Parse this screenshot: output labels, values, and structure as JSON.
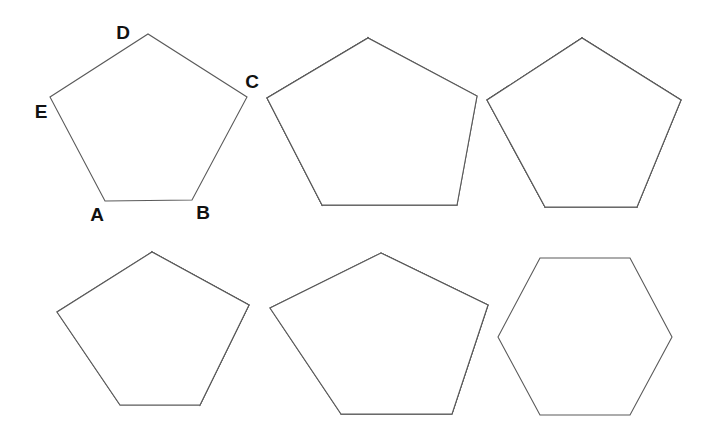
{
  "figure": {
    "background_color": "#ffffff",
    "stroke_color": "#5a5a5a",
    "label_color": "#111111",
    "width": 719,
    "height": 442
  },
  "labels": {
    "A": "A",
    "B": "B",
    "C": "C",
    "D": "D",
    "E": "E"
  },
  "shapes": [
    {
      "id": "pentagon-1-labeled",
      "name": "labeled-pentagon",
      "type": "pentagon",
      "row": 1,
      "column": 1,
      "fill": "none",
      "vertex_labels": [
        "A",
        "B",
        "C",
        "D",
        "E"
      ],
      "regions": []
    },
    {
      "id": "pentagon-2-two-triangles",
      "name": "pentagon-with-two-hatched-triangles",
      "type": "pentagon",
      "row": 1,
      "column": 2,
      "regions": [
        {
          "name": "left-triangle",
          "pattern": "diagonal-hatch",
          "vertices": "D-E-A"
        },
        {
          "name": "middle-triangle",
          "pattern": "cross-hatch",
          "vertices": "D-A-B"
        }
      ]
    },
    {
      "id": "pentagon-3-three-quads",
      "name": "pentagon-split-into-three-quadrilaterals",
      "type": "pentagon",
      "row": 1,
      "column": 3,
      "regions": [
        {
          "name": "left-quad",
          "pattern": "horizontal-hatch",
          "vertices": "D-E-A-center"
        },
        {
          "name": "right-quad",
          "pattern": "vertical-hatch",
          "vertices": "D-center-B-C"
        },
        {
          "name": "bottom-quad",
          "pattern": "none",
          "vertices": "center-A-B"
        }
      ]
    },
    {
      "id": "pentagon-4-one-triangle",
      "name": "pentagon-with-horizontal-hatched-triangle",
      "type": "pentagon",
      "row": 2,
      "column": 1,
      "regions": [
        {
          "name": "right-triangle",
          "pattern": "horizontal-hatch",
          "vertices": "D-C-B"
        }
      ]
    },
    {
      "id": "pentagon-5-one-quad",
      "name": "pentagon-with-cross-hatched-quadrilateral",
      "type": "pentagon",
      "row": 2,
      "column": 2,
      "regions": [
        {
          "name": "right-quad",
          "pattern": "cross-hatch",
          "vertices": "D-C-B-A"
        }
      ]
    },
    {
      "id": "hexagon-6-plain",
      "name": "plain-hexagon",
      "type": "hexagon",
      "row": 2,
      "column": 3,
      "regions": []
    }
  ],
  "patterns": {
    "diagonal-hatch": {
      "name": "diagonal-hatch",
      "color": "#4a4a4a",
      "spacing": 4
    },
    "cross-hatch": {
      "name": "cross-hatch",
      "color": "#4a4a4a",
      "spacing": 4
    },
    "horizontal-hatch": {
      "name": "horizontal-hatch",
      "color": "#3a3a3a",
      "spacing": 6
    },
    "vertical-hatch": {
      "name": "vertical-hatch",
      "color": "#3a3a3a",
      "spacing": 6
    }
  },
  "geometry": {
    "pentagon1": {
      "A": "105,201",
      "B": "192,200",
      "C": "247,97",
      "D": "148,34",
      "E": "50,97"
    },
    "pentagon2": {
      "A": "322,205",
      "B": "457,205",
      "C": "477,96",
      "D": "368,38",
      "E": "267,98"
    },
    "pentagon3": {
      "A": "545,207",
      "B": "637,207",
      "C": "681,100",
      "D": "582,38",
      "E": "487,100",
      "center": "581,130"
    },
    "pentagon4": {
      "A": "120,405",
      "B": "200,405",
      "C": "249,305",
      "D": "152,252",
      "E": "57,312"
    },
    "pentagon5": {
      "A": "341,414",
      "B": "452,414",
      "C": "488,305",
      "D": "381,253",
      "E": "270,308"
    },
    "hexagon6": {
      "P1": "540,258",
      "P2": "630,258",
      "P3": "672,337",
      "P4": "630,415",
      "P5": "540,415",
      "P6": "498,337"
    }
  }
}
